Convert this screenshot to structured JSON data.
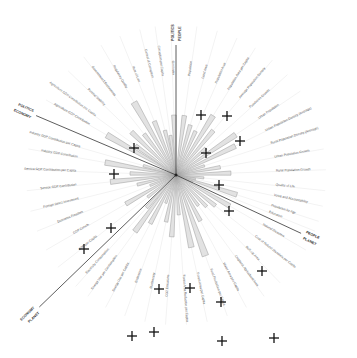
{
  "diagram": {
    "type": "radial-star-plot",
    "center": [
      176,
      175
    ],
    "sections": [
      {
        "name": "POLITICS",
        "boundary_label_a": "POLITICS",
        "boundary_label_b": "PEOPLE"
      },
      {
        "name": "PEOPLE"
      },
      {
        "name": "PLANET"
      },
      {
        "name": "ECONOMY"
      }
    ],
    "boundaries": [
      {
        "id": "politics-people",
        "angle": -90,
        "len": 130,
        "labels": [
          "POLITICS",
          "PEOPLE"
        ]
      },
      {
        "id": "people-planet",
        "angle": 25,
        "len": 138,
        "labels": [
          "PEOPLE",
          "PLANET"
        ]
      },
      {
        "id": "planet-economy",
        "angle": 136,
        "len": 190,
        "labels": [
          "PLANET",
          "ECONOMY"
        ]
      },
      {
        "id": "economy-politics",
        "angle": 203,
        "len": 152,
        "labels": [
          "ECONOMY",
          "POLITICS"
        ]
      }
    ],
    "axes": [
      {
        "label": "Population",
        "angle": -82
      },
      {
        "label": "Land Area",
        "angle": -74
      },
      {
        "label": "Population Area",
        "angle": -66
      },
      {
        "label": "Population Area per Capita",
        "angle": -58
      },
      {
        "label": "Average Population Density",
        "angle": -50
      },
      {
        "label": "Population Growth",
        "angle": -42
      },
      {
        "label": "Urban Population",
        "angle": -34
      },
      {
        "label": "Urban Population Density (Average)",
        "angle": -26
      },
      {
        "label": "Rural Population Density (Average)",
        "angle": -18
      },
      {
        "label": "Urban Population Growth",
        "angle": -10
      },
      {
        "label": "Rural Population Growth",
        "angle": -2
      },
      {
        "label": "Quality of Life",
        "angle": 6
      },
      {
        "label": "Voice and Accountability",
        "angle": 12
      },
      {
        "label": "Population by Age",
        "angle": 18
      },
      {
        "label": "Education",
        "angle": 22
      },
      {
        "label": "Natural Disasters",
        "angle": 30
      },
      {
        "label": "Cost of Natural Disasters per Capita",
        "angle": 38
      },
      {
        "label": "Built-Up Area",
        "angle": 46
      },
      {
        "label": "Cropland, Agricultural Area",
        "angle": 54
      },
      {
        "label": "Water Area per Capita",
        "angle": 62
      },
      {
        "label": "Food Production per Capita",
        "angle": 70
      },
      {
        "label": "Forest Area per Capita",
        "angle": 78
      },
      {
        "label": "Forest Area Reduction per Capita",
        "angle": 86
      },
      {
        "label": "CO2 Emissions",
        "angle": 94
      },
      {
        "label": "Biodiversity",
        "angle": 102
      },
      {
        "label": "Endemism",
        "angle": 110
      },
      {
        "label": "Energy Use per Capita",
        "angle": 118
      },
      {
        "label": "Energy Use per Consumption",
        "angle": 126
      },
      {
        "label": "Electricity Consumption",
        "angle": 132
      },
      {
        "label": "GDP per Capita",
        "angle": 142
      },
      {
        "label": "GDP Growth",
        "angle": 150
      },
      {
        "label": "Economic Freedom",
        "angle": 158
      },
      {
        "label": "Foreign Direct Investment",
        "angle": 166
      },
      {
        "label": "Service GDP Contribution",
        "angle": 174
      },
      {
        "label": "Service GDP Contribution per Capita",
        "angle": 182
      },
      {
        "label": "Industry GDP Contribution",
        "angle": 190
      },
      {
        "label": "Industry GDP Contribution per Capita",
        "angle": 196
      },
      {
        "label": "Agriculture GDP Contribution",
        "angle": 210
      },
      {
        "label": "Agriculture GDP Contribution per Capita",
        "angle": 216
      },
      {
        "label": "Political Stability",
        "angle": 224
      },
      {
        "label": "Government Effectiveness",
        "angle": 232
      },
      {
        "label": "Regulatory Quality",
        "angle": 240
      },
      {
        "label": "Rule of Law",
        "angle": 248
      },
      {
        "label": "Control of Corruption",
        "angle": 256
      },
      {
        "label": "Corruption per Capita",
        "angle": 262
      },
      {
        "label": "Gini Index",
        "angle": 268
      }
    ],
    "markers": [
      [
        201,
        115
      ],
      [
        227,
        116
      ],
      [
        240,
        141
      ],
      [
        206,
        153
      ],
      [
        219,
        185
      ],
      [
        229,
        211
      ],
      [
        262,
        271
      ],
      [
        134,
        148
      ],
      [
        114,
        174
      ],
      [
        111,
        228
      ],
      [
        84,
        249
      ],
      [
        159,
        289
      ],
      [
        132,
        336
      ],
      [
        154,
        332
      ],
      [
        222,
        341
      ],
      [
        274,
        338
      ],
      [
        221,
        302
      ],
      [
        190,
        288
      ]
    ]
  }
}
